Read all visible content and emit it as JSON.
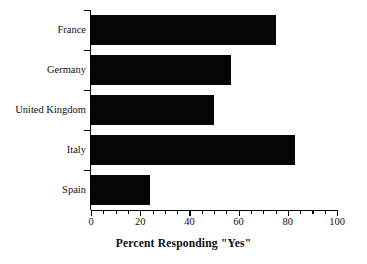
{
  "chart_data": {
    "type": "bar",
    "orientation": "horizontal",
    "title": "",
    "xlabel": "Percent Responding \"Yes\"",
    "ylabel": "",
    "categories": [
      "France",
      "Germany",
      "United Kingdom",
      "Italy",
      "Spain"
    ],
    "values": [
      75,
      57,
      50,
      83,
      24
    ],
    "xlim": [
      0,
      100
    ],
    "xticks": [
      0,
      20,
      40,
      60,
      80,
      100
    ],
    "xtick_labels": [
      "0",
      "20",
      "40",
      "60",
      "80",
      "100"
    ],
    "minor_tick_step": 5,
    "grid": false,
    "legend": null,
    "bar_color": "#050505",
    "background_color": "#ffffff",
    "axis_color": "#000000"
  },
  "axis": {
    "x_title": "Percent Responding \"Yes\"",
    "tick_labels": [
      "0",
      "20",
      "40",
      "60",
      "80",
      "100"
    ]
  },
  "bars": [
    {
      "label": "France",
      "value": 75
    },
    {
      "label": "Germany",
      "value": 57
    },
    {
      "label": "United Kingdom",
      "value": 50
    },
    {
      "label": "Italy",
      "value": 83
    },
    {
      "label": "Spain",
      "value": 24
    }
  ]
}
